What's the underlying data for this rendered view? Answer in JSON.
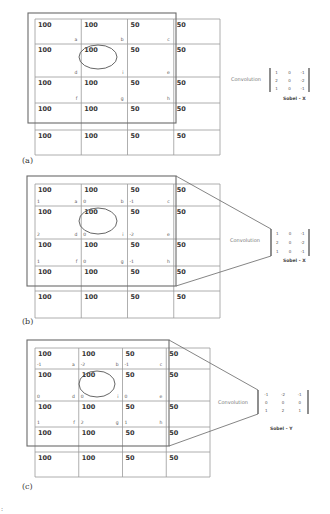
{
  "figure": {
    "image_values": [
      [
        "100",
        "100",
        "50",
        "50"
      ],
      [
        "100",
        "100",
        "50",
        "50"
      ],
      [
        "100",
        "100",
        "50",
        "50"
      ],
      [
        "100",
        "100",
        "50",
        "50"
      ],
      [
        "100",
        "100",
        "50",
        "50"
      ]
    ],
    "cell_letters": [
      [
        "a",
        "b",
        "c"
      ],
      [
        "d",
        "i",
        "e"
      ],
      [
        "f",
        "g",
        "h"
      ]
    ],
    "convolution_label": "Convolution",
    "panels": [
      {
        "caption": "(a)",
        "kernel_name": "Sobel - X",
        "kernel": [
          [
            "1",
            "0",
            "-1"
          ],
          [
            "2",
            "0",
            "-2"
          ],
          [
            "1",
            "0",
            "-1"
          ]
        ],
        "show_weights": false,
        "projection_lines": false
      },
      {
        "caption": "(b)",
        "kernel_name": "Sobel - X",
        "kernel": [
          [
            "1",
            "0",
            "-1"
          ],
          [
            "2",
            "0",
            "-2"
          ],
          [
            "1",
            "0",
            "-1"
          ]
        ],
        "show_weights": true,
        "projection_lines": true
      },
      {
        "caption": "(c)",
        "kernel_name": "Sobel - Y",
        "kernel": [
          [
            "-1",
            "-2",
            "-1"
          ],
          [
            "0",
            "0",
            "0"
          ],
          [
            "1",
            "2",
            "1"
          ]
        ],
        "show_weights": true,
        "projection_lines": true
      }
    ],
    "stray_mark": ":"
  }
}
